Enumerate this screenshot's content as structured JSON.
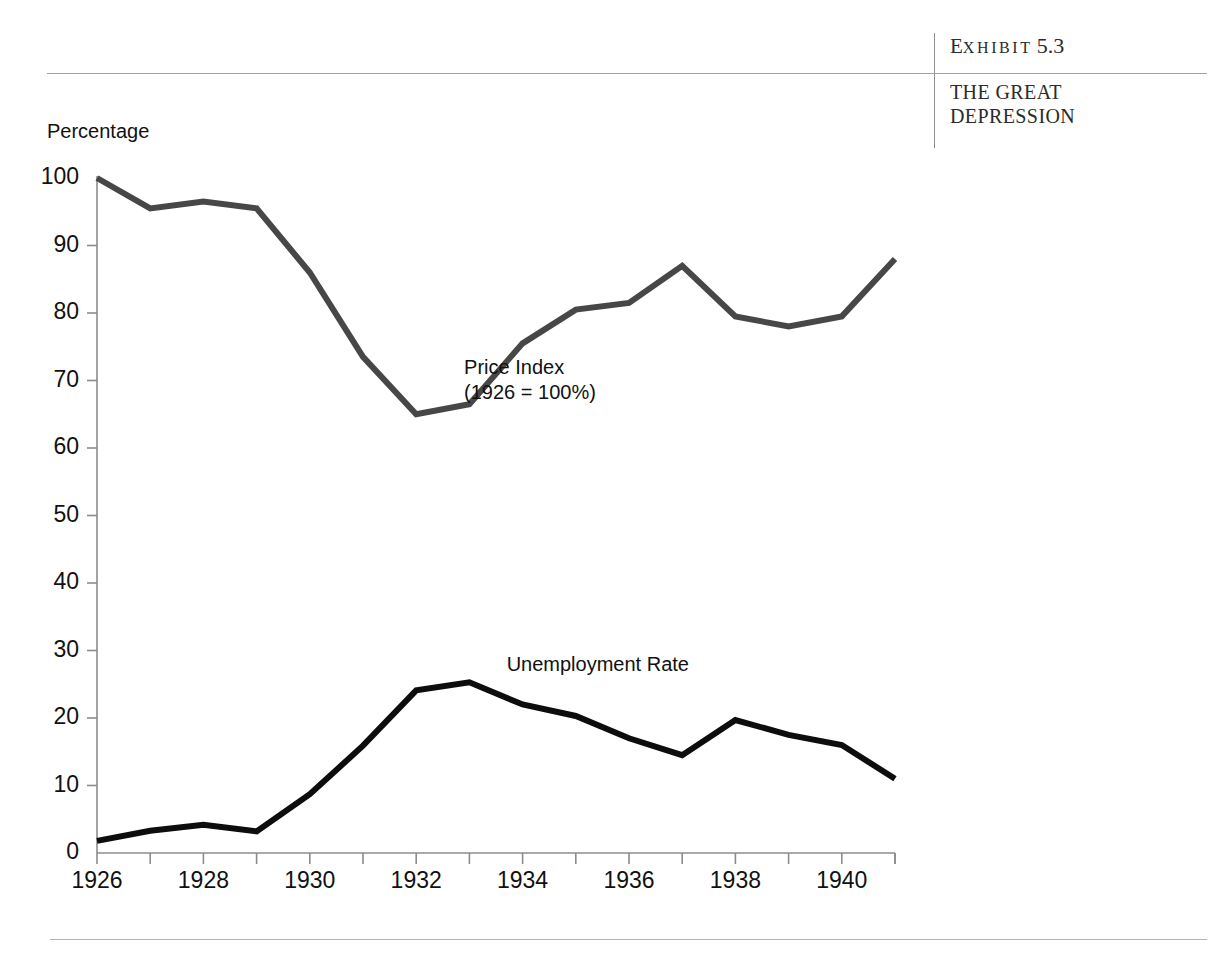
{
  "exhibit": {
    "number_prefix": "E",
    "number_word": "XHIBIT",
    "number_value": "5.3",
    "subtitle_line1": "THE GREAT",
    "subtitle_line2": "DEPRESSION"
  },
  "chart_data": {
    "type": "line",
    "title": "THE GREAT DEPRESSION",
    "xlabel": "",
    "ylabel": "Percentage",
    "ylim": [
      0,
      100
    ],
    "xlim": [
      1926,
      1941
    ],
    "grid": false,
    "y_ticks": [
      0,
      10,
      20,
      30,
      40,
      50,
      60,
      70,
      80,
      90,
      100
    ],
    "y_tick_labels": [
      "0",
      "10",
      "20",
      "30",
      "40",
      "50",
      "60",
      "70",
      "80",
      "90",
      "100"
    ],
    "x_ticks": [
      1926,
      1927,
      1928,
      1929,
      1930,
      1931,
      1932,
      1933,
      1934,
      1935,
      1936,
      1937,
      1938,
      1939,
      1940,
      1941
    ],
    "x_tick_labels": [
      "1926",
      "",
      "1928",
      "",
      "1930",
      "",
      "1932",
      "",
      "1934",
      "",
      "1936",
      "",
      "1938",
      "",
      "1940",
      ""
    ],
    "x": [
      1926,
      1927,
      1928,
      1929,
      1930,
      1931,
      1932,
      1933,
      1934,
      1935,
      1936,
      1937,
      1938,
      1939,
      1940,
      1941
    ],
    "series": [
      {
        "name": "Price Index (1926 = 100%)",
        "label_line1": "Price Index",
        "label_line2": "(1926 = 100%)",
        "color": "#474747",
        "width": 6,
        "values": [
          100.0,
          95.5,
          96.5,
          95.5,
          86.0,
          73.5,
          65.0,
          66.5,
          75.5,
          80.5,
          81.5,
          87.0,
          79.5,
          78.0,
          79.5,
          88.0
        ]
      },
      {
        "name": "Unemployment Rate",
        "label_line1": "Unemployment Rate",
        "label_line2": "",
        "color": "#0d0d0d",
        "width": 6,
        "values": [
          1.8,
          3.3,
          4.2,
          3.2,
          8.7,
          15.9,
          24.1,
          25.3,
          22.0,
          20.3,
          17.0,
          14.5,
          19.7,
          17.5,
          16.0,
          11.0
        ]
      }
    ],
    "annotations": [
      {
        "text": "Price Index\n(1926 = 100%)",
        "x": 1932.9,
        "y": 72
      },
      {
        "text": "Unemployment Rate",
        "x": 1933.7,
        "y": 28
      }
    ],
    "axis_color": "#8c8c8c"
  }
}
